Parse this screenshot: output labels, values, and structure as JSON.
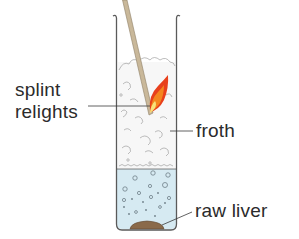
{
  "diagram": {
    "labels": {
      "splint": [
        "splint",
        "relights"
      ],
      "froth": "froth",
      "liver": "raw liver"
    },
    "colors": {
      "tube_outline": "#5a5a5a",
      "liquid": "#d6eaf2",
      "froth_fill": "#f6f6f6",
      "froth_outline": "#9a9a9a",
      "splint": "#c9b89a",
      "splint_edge": "#8f7f66",
      "flame_outer": "#e8401c",
      "flame_mid": "#f4861f",
      "flame_inner": "#f8e27a",
      "liver": "#8a6a4a",
      "bubble": "#6e7f88",
      "leader_line": "#3a3a3a",
      "text": "#2b2b2b"
    }
  }
}
